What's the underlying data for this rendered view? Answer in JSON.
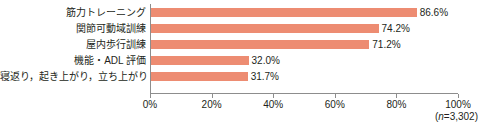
{
  "chart_data": {
    "type": "bar",
    "orientation": "horizontal",
    "title": "",
    "xlabel": "",
    "ylabel": "",
    "xlim": [
      0,
      100
    ],
    "xticks": [
      "0%",
      "20%",
      "40%",
      "60%",
      "80%",
      "100%"
    ],
    "xtick_values": [
      0,
      20,
      40,
      60,
      80,
      100
    ],
    "grid": false,
    "legend": "none",
    "bar_color": "#ed8c72",
    "axis_color": "#8d8d8d",
    "text_color": "#231f20",
    "categories": [
      "筋力トレーニング",
      "関節可動域訓練",
      "屋内歩行訓練",
      "機能・ADL 評価",
      "寝返り，起き上がり，立ち上がり"
    ],
    "values": [
      86.6,
      74.2,
      71.2,
      32.0,
      31.7
    ],
    "value_labels": [
      "86.6%",
      "74.2%",
      "71.2%",
      "32.0%",
      "31.7%"
    ],
    "note": {
      "prefix": "(",
      "symbol": "n",
      "equals": "=",
      "value": "3,302",
      "suffix": ")"
    }
  }
}
